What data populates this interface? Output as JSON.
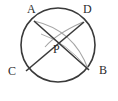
{
  "figure": {
    "background_color": "#ffffff",
    "stroke_color": "#3a3a3a",
    "arc_color": "#9a9a9a",
    "label_color": "#2b2b2b"
  },
  "labels": {
    "A": "A",
    "B": "B",
    "C": "C",
    "D": "D",
    "P": "P"
  },
  "icons": {
    "circle": "circle-outline-icon",
    "chord_ab": "chord-line-icon",
    "chord_cd": "chord-line-icon",
    "arc_ab": "arc-curve-icon",
    "arc_dc": "arc-curve-icon"
  },
  "geometry": {
    "circle": {
      "cx": 58,
      "cy": 45,
      "r": 37
    },
    "points": {
      "A": {
        "x": 34,
        "y": 21
      },
      "B": {
        "x": 88,
        "y": 69
      },
      "C": {
        "x": 27,
        "y": 71
      },
      "D": {
        "x": 83,
        "y": 22
      },
      "P": {
        "x": 59,
        "y": 42
      }
    },
    "chords": [
      {
        "name": "AB",
        "from": "A",
        "to": "B"
      },
      {
        "name": "CD",
        "from": "C",
        "to": "D"
      }
    ],
    "arcs": [
      {
        "name": "arc-A-to-B",
        "from": "A",
        "to": "B",
        "through_near": "P"
      },
      {
        "name": "arc-D-to-C",
        "from": "D",
        "to": "C",
        "through_near": "P"
      }
    ]
  }
}
